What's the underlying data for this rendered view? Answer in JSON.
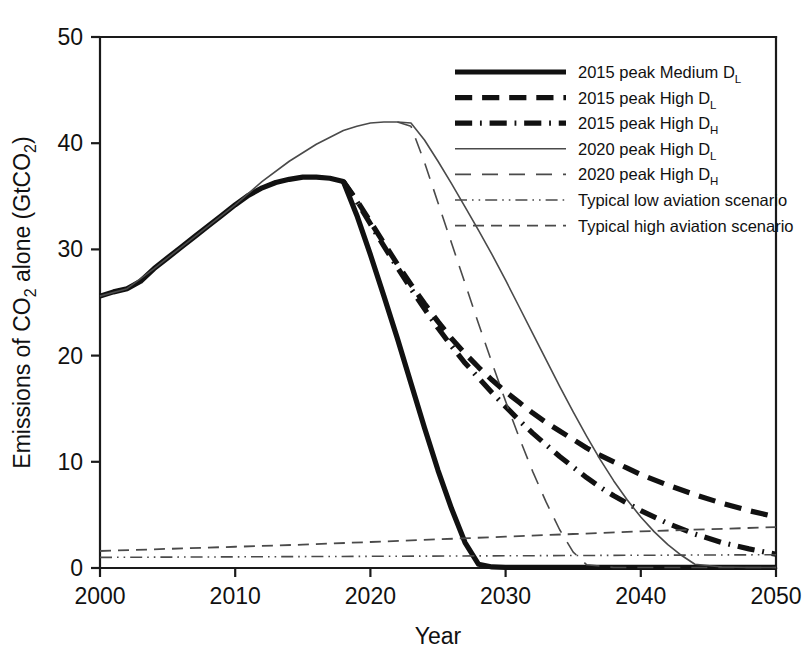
{
  "chart_data": {
    "type": "line",
    "title": "",
    "xlabel": "Year",
    "ylabel": "Emissions of CO2 alone (GtCO2)",
    "ylabel_parts": {
      "pre": "Emissions of CO",
      "sub1": "2",
      "mid": " alone (GtCO",
      "sub2": "2",
      "post": ")"
    },
    "xlim": [
      2000,
      2050
    ],
    "ylim": [
      0,
      50
    ],
    "xticks": [
      2000,
      2010,
      2020,
      2030,
      2040,
      2050
    ],
    "yticks": [
      0,
      10,
      20,
      30,
      40,
      50
    ],
    "grid": false,
    "legend_position": "upper-right-inside",
    "series": [
      {
        "name": "2015 peak Medium D_L",
        "label_pre": "2015 peak Medium D",
        "label_sub": "L",
        "style": "solid",
        "width": 5.2,
        "color": "#111111",
        "x": [
          2000,
          2001,
          2002,
          2003,
          2004,
          2005,
          2006,
          2007,
          2008,
          2009,
          2010,
          2011,
          2012,
          2013,
          2014,
          2015,
          2016,
          2017,
          2018,
          2019,
          2020,
          2021,
          2022,
          2023,
          2024,
          2025,
          2026,
          2027,
          2028,
          2029,
          2030,
          2035,
          2040,
          2045,
          2050
        ],
        "y": [
          25.6,
          26.0,
          26.3,
          27.0,
          28.2,
          29.2,
          30.2,
          31.2,
          32.2,
          33.2,
          34.2,
          35.1,
          35.8,
          36.3,
          36.6,
          36.8,
          36.8,
          36.7,
          36.4,
          33.2,
          29.5,
          25.6,
          21.6,
          17.4,
          13.2,
          9.2,
          5.6,
          2.4,
          0.35,
          0.1,
          0.05,
          0.05,
          0.05,
          0.05,
          0.05
        ]
      },
      {
        "name": "2015 peak High D_L",
        "label_pre": "2015 peak High D",
        "label_sub": "L",
        "style": "dashed",
        "width": 5.2,
        "color": "#111111",
        "x": [
          2018,
          2019,
          2020,
          2021,
          2022,
          2023,
          2024,
          2025,
          2026,
          2027,
          2028,
          2029,
          2030,
          2031,
          2032,
          2033,
          2034,
          2035,
          2036,
          2037,
          2038,
          2039,
          2040,
          2042,
          2044,
          2046,
          2048,
          2050
        ],
        "y": [
          36.4,
          34.6,
          32.6,
          30.6,
          28.6,
          26.7,
          24.9,
          23.2,
          21.6,
          20.2,
          18.9,
          17.7,
          16.6,
          15.6,
          14.6,
          13.7,
          12.9,
          12.1,
          11.3,
          10.6,
          10.0,
          9.4,
          8.8,
          7.8,
          6.9,
          6.1,
          5.4,
          4.8
        ]
      },
      {
        "name": "2015 peak High D_H",
        "label_pre": "2015 peak High D",
        "label_sub": "H",
        "style": "dashdot",
        "width": 5.2,
        "color": "#111111",
        "x": [
          2018,
          2019,
          2020,
          2021,
          2022,
          2023,
          2024,
          2025,
          2026,
          2027,
          2028,
          2029,
          2030,
          2031,
          2032,
          2033,
          2034,
          2035,
          2036,
          2037,
          2038,
          2039,
          2040,
          2042,
          2044,
          2046,
          2048,
          2050
        ],
        "y": [
          36.4,
          34.5,
          32.4,
          30.3,
          28.3,
          26.3,
          24.4,
          22.6,
          20.9,
          19.3,
          17.9,
          16.5,
          15.2,
          13.9,
          12.7,
          11.6,
          10.5,
          9.5,
          8.5,
          7.6,
          6.8,
          6.1,
          5.4,
          4.2,
          3.2,
          2.4,
          1.8,
          1.3
        ]
      },
      {
        "name": "2020 peak High D_L",
        "label_pre": "2020 peak High D",
        "label_sub": "L",
        "style": "solid",
        "width": 1.6,
        "color": "#4a4a4a",
        "x": [
          2000,
          2002,
          2004,
          2006,
          2008,
          2010,
          2012,
          2014,
          2016,
          2018,
          2019,
          2020,
          2021,
          2022,
          2023,
          2024,
          2025,
          2026,
          2027,
          2028,
          2029,
          2030,
          2031,
          2032,
          2033,
          2034,
          2035,
          2036,
          2037,
          2038,
          2039,
          2040,
          2041,
          2042,
          2043,
          2044,
          2046,
          2048,
          2050
        ],
        "y": [
          25.6,
          26.3,
          28.2,
          30.2,
          32.2,
          34.2,
          36.4,
          38.3,
          39.9,
          41.2,
          41.6,
          41.9,
          42.0,
          42.0,
          41.9,
          40.3,
          38.3,
          36.2,
          34.0,
          31.8,
          29.5,
          27.1,
          24.6,
          22.1,
          19.6,
          17.1,
          14.7,
          12.4,
          10.2,
          8.2,
          6.4,
          4.8,
          3.4,
          2.2,
          1.2,
          0.35,
          0.1,
          0.05,
          0.05
        ]
      },
      {
        "name": "2020 peak High D_H",
        "label_pre": "2020 peak High D",
        "label_sub": "H",
        "style": "longdash",
        "width": 1.6,
        "color": "#4a4a4a",
        "x": [
          2022,
          2023,
          2024,
          2025,
          2026,
          2027,
          2028,
          2029,
          2030,
          2031,
          2032,
          2033,
          2034,
          2035,
          2036,
          2038,
          2040,
          2045,
          2050
        ],
        "y": [
          42.0,
          41.6,
          38.2,
          34.4,
          30.6,
          26.8,
          23.0,
          19.3,
          15.7,
          12.3,
          9.1,
          6.2,
          3.6,
          1.5,
          0.3,
          0.05,
          0.05,
          0.05,
          0.05
        ]
      },
      {
        "name": "Typical low aviation scenario",
        "label_pre": "Typical low aviation scenario",
        "label_sub": "",
        "style": "dashdotdot",
        "width": 1.6,
        "color": "#4a4a4a",
        "x": [
          2000,
          2010,
          2020,
          2030,
          2040,
          2050
        ],
        "y": [
          1.0,
          1.05,
          1.1,
          1.15,
          1.2,
          1.25
        ]
      },
      {
        "name": "Typical high aviation scenario",
        "label_pre": "Typical high aviation scenario",
        "label_sub": "",
        "style": "grayDashed",
        "width": 1.8,
        "color": "#4a4a4a",
        "x": [
          2000,
          2005,
          2010,
          2015,
          2020,
          2025,
          2030,
          2035,
          2040,
          2045,
          2050
        ],
        "y": [
          1.6,
          1.8,
          2.0,
          2.2,
          2.45,
          2.7,
          2.95,
          3.2,
          3.45,
          3.65,
          3.85
        ]
      }
    ]
  }
}
